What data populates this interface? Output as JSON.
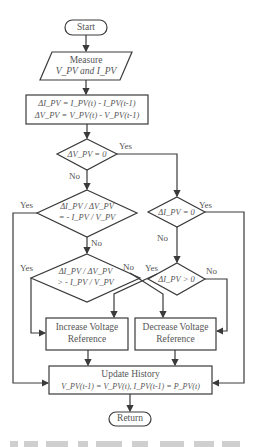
{
  "flowchart": {
    "start": "Start",
    "measure": {
      "line1": "Measure",
      "line2": "V_PV and I_PV"
    },
    "compute": {
      "line1": "ΔI_PV = I_PV(t) - I_PV(t-1)",
      "line2": "ΔV_PV = V_PV(t) - V_PV(t-1)"
    },
    "decision_dv_zero": "ΔV_PV = 0",
    "decision_inc_equal": {
      "line1": "ΔI_PV / ΔV_PV",
      "line2": "= - I_PV / V_PV"
    },
    "decision_inc_greater": {
      "line1": "ΔI_PV / ΔV_PV",
      "line2": "> - I_PV / V_PV"
    },
    "decision_di_zero": "ΔI_PV = 0",
    "decision_di_positive": "ΔI_PV > 0",
    "increase": {
      "line1": "Increase Voltage",
      "line2": "Reference"
    },
    "decrease": {
      "line1": "Decrease Voltage",
      "line2": "Reference"
    },
    "update": {
      "line1": "Update History",
      "line2": "V_PV(t-1) = V_PV(t), I_PV(t-1) = P_PV(t)"
    },
    "return": "Return",
    "labels": {
      "yes": "Yes",
      "no": "No"
    }
  },
  "colors": {
    "stroke": "#3a3a3a",
    "text": "#555555",
    "background": "#ffffff"
  }
}
